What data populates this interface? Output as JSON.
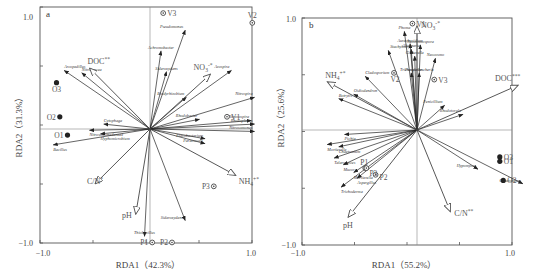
{
  "chart_data": [
    {
      "type": "scatter",
      "panel": "a",
      "title": "a",
      "xlabel": "RDA1（42.3%）",
      "ylabel": "RDA2（31.3%）",
      "xlim": [
        -1.0,
        1.0
      ],
      "ylim": [
        -1.0,
        1.0
      ],
      "x_ticks": [
        "-1.0",
        "1.0"
      ],
      "y_ticks": [
        "1.0",
        "-1.0"
      ],
      "env_arrows": [
        {
          "label": "DOC**",
          "x": -0.55,
          "y": 0.5
        },
        {
          "label": "NO3-*",
          "x": 0.55,
          "y": 0.45
        },
        {
          "label": "C/N*",
          "x": -0.5,
          "y": -0.45
        },
        {
          "label": "NH4+*",
          "x": 0.78,
          "y": -0.38
        },
        {
          "label": "pH",
          "x": -0.13,
          "y": -0.7
        }
      ],
      "species_arrows": [
        {
          "label": "Arcopedillus",
          "x": -0.78,
          "y": 0.48
        },
        {
          "label": "Nitrolancea",
          "x": -0.62,
          "y": 0.46
        },
        {
          "label": "Pseudomonas",
          "x": 0.32,
          "y": 0.81
        },
        {
          "label": "Achromobacter",
          "x": 0.1,
          "y": 0.64
        },
        {
          "label": "Sideroxydans",
          "x": 0.15,
          "y": 0.47
        },
        {
          "label": "Azospira",
          "x": 0.74,
          "y": 0.48
        },
        {
          "label": "Bradyrhizobium",
          "x": 0.33,
          "y": 0.26
        },
        {
          "label": "Nitrospira",
          "x": 0.95,
          "y": 0.26
        },
        {
          "label": "Rhodobacter",
          "x": 0.45,
          "y": 0.08
        },
        {
          "label": "Nitrosospira",
          "x": 0.92,
          "y": 0.07
        },
        {
          "label": "Rhodoplanes",
          "x": 0.95,
          "y": 0.04
        },
        {
          "label": "Nitrosomonas",
          "x": 0.95,
          "y": -0.02
        },
        {
          "label": "Flavobacterium",
          "x": 0.5,
          "y": -0.08
        },
        {
          "label": "Paracoccus",
          "x": 0.5,
          "y": -0.12
        },
        {
          "label": "Cytophaga",
          "x": -0.42,
          "y": 0.04
        },
        {
          "label": "Nitrosomonadaceae",
          "x": -0.55,
          "y": -0.01
        },
        {
          "label": "Hyphomicrobium",
          "x": -0.45,
          "y": -0.04
        },
        {
          "label": "Bacillus",
          "x": -0.88,
          "y": -0.13
        },
        {
          "label": "Sideroxydans",
          "x": 0.32,
          "y": -0.75
        },
        {
          "label": "Thiobacillus",
          "x": -0.05,
          "y": -0.88
        }
      ],
      "sites": [
        {
          "label": "V1",
          "x": 0.7,
          "y": 0.1,
          "type": "open"
        },
        {
          "label": "V2",
          "x": 0.93,
          "y": 0.87,
          "type": "open"
        },
        {
          "label": "V3",
          "x": 0.12,
          "y": 0.95,
          "type": "open"
        },
        {
          "label": "O1",
          "x": -0.75,
          "y": -0.05,
          "type": "filled"
        },
        {
          "label": "O2",
          "x": -0.82,
          "y": 0.1,
          "type": "filled"
        },
        {
          "label": "O3",
          "x": -0.85,
          "y": 0.38,
          "type": "filled"
        },
        {
          "label": "P1",
          "x": 0.02,
          "y": -0.93,
          "type": "open"
        },
        {
          "label": "P2",
          "x": 0.2,
          "y": -0.93,
          "type": "open"
        },
        {
          "label": "P3",
          "x": 0.58,
          "y": -0.47,
          "type": "open"
        }
      ]
    },
    {
      "type": "scatter",
      "panel": "b",
      "title": "b",
      "xlabel": "RDA1（55.2%）",
      "ylabel": "RDA2（25.6%）",
      "xlim": [
        -1.0,
        1.0
      ],
      "ylim": [
        -1.0,
        1.0
      ],
      "x_ticks": [
        "-1.0",
        "1.0"
      ],
      "y_ticks": [
        "1.0",
        "-1.0"
      ],
      "env_arrows": [
        {
          "label": "NO3-*",
          "x": 0.0,
          "y": 0.93
        },
        {
          "label": "DOC***",
          "x": 0.88,
          "y": 0.4
        },
        {
          "label": "NH4+*",
          "x": -0.78,
          "y": 0.43
        },
        {
          "label": "pH",
          "x": -0.6,
          "y": -0.78
        },
        {
          "label": "C/N**",
          "x": 0.29,
          "y": -0.73
        }
      ],
      "species_arrows": [
        {
          "label": "Phoma",
          "x": -0.11,
          "y": 0.88
        },
        {
          "label": "Aureobasidium",
          "x": -0.06,
          "y": 0.77
        },
        {
          "label": "Alternaria",
          "x": -0.05,
          "y": 0.72
        },
        {
          "label": "Gibberella",
          "x": -0.02,
          "y": 0.66
        },
        {
          "label": "Neocosmospora",
          "x": 0.03,
          "y": 0.76
        },
        {
          "label": "Neocosmo",
          "x": 0.16,
          "y": 0.64
        },
        {
          "label": "Stachybotrys",
          "x": -0.25,
          "y": 0.71
        },
        {
          "label": "Cladosporium",
          "x": -0.45,
          "y": 0.48
        },
        {
          "label": "Trichosporon",
          "x": -0.05,
          "y": 0.51
        },
        {
          "label": "Pseudallescheria",
          "x": 0.02,
          "y": 0.51
        },
        {
          "label": "Oidiodendron",
          "x": -0.55,
          "y": 0.32
        },
        {
          "label": "Botrytis",
          "x": -0.68,
          "y": 0.28
        },
        {
          "label": "Penicillium",
          "x": 0.24,
          "y": 0.22
        },
        {
          "label": "Rhodotorula",
          "x": 0.4,
          "y": 0.14
        },
        {
          "label": "Pichia",
          "x": -0.63,
          "y": -0.04
        },
        {
          "label": "Mortierella",
          "x": -0.78,
          "y": -0.13
        },
        {
          "label": "Chaetomium",
          "x": -0.68,
          "y": -0.15
        },
        {
          "label": "Talaromyces",
          "x": -0.72,
          "y": -0.25
        },
        {
          "label": "Mucor",
          "x": -0.64,
          "y": -0.31
        },
        {
          "label": "Mortierella",
          "x": -0.55,
          "y": -0.38
        },
        {
          "label": "Aspergillus",
          "x": -0.52,
          "y": -0.43
        },
        {
          "label": "Trichoderma",
          "x": -0.66,
          "y": -0.51
        },
        {
          "label": "Hypomyces",
          "x": 0.53,
          "y": -0.35
        },
        {
          "label": "Chaetomium",
          "x": 0.92,
          "y": -0.48
        }
      ],
      "sites": [
        {
          "label": "V1",
          "x": -0.04,
          "y": 0.95,
          "type": "open"
        },
        {
          "label": "V2",
          "x": -0.2,
          "y": 0.51,
          "type": "open"
        },
        {
          "label": "V3",
          "x": 0.15,
          "y": 0.45,
          "type": "open"
        },
        {
          "label": "O1",
          "x": 0.72,
          "y": -0.28,
          "type": "filled"
        },
        {
          "label": "O2",
          "x": 0.75,
          "y": -0.45,
          "type": "filled"
        },
        {
          "label": "O3",
          "x": 0.72,
          "y": -0.24,
          "type": "filled"
        },
        {
          "label": "P1",
          "x": -0.45,
          "y": -0.34,
          "type": "open"
        },
        {
          "label": "P2",
          "x": -0.36,
          "y": -0.4,
          "type": "open"
        },
        {
          "label": "P3",
          "x": -0.44,
          "y": -0.34,
          "type": "open"
        }
      ]
    }
  ],
  "panels": {
    "a": {
      "letter": "a",
      "xlabel": "RDA1（42.3%）",
      "ylabel": "RDA2（31.3%）",
      "xtick_min": "−1.0",
      "xtick_max": "1.0",
      "ytick_max": "1.0",
      "ytick_min": "−1.0"
    },
    "b": {
      "letter": "b",
      "xlabel": "RDA1（55.2%）",
      "ylabel": "RDA2（25.6%）",
      "xtick_min": "−1.0",
      "xtick_max": "1.0",
      "ytick_max": "1.0",
      "ytick_min": "−1.0"
    }
  }
}
